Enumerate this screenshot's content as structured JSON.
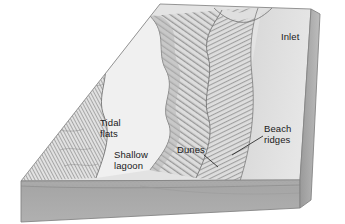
{
  "figure": {
    "type": "geologic-block-diagram",
    "background_color": "#ffffff"
  },
  "labels": {
    "inlet": "Inlet",
    "beach_ridges": "Beach\nridges",
    "dunes": "Dunes",
    "tidal_flats": "Tidal\nflats",
    "shallow_lagoon": "Shallow\nlagoon"
  },
  "colors": {
    "background": "#ffffff",
    "top_surface": "#e4e4e4",
    "lagoon": "#efefef",
    "ocean": "#dadada",
    "front_face": "#a9a9a9",
    "side_face": "#9b9b9b",
    "ink": "#6a6a6a",
    "text": "#1a1a1a"
  },
  "features": [
    {
      "name": "inlet",
      "description": "tidal inlet breaching the barrier"
    },
    {
      "name": "beach-ridges",
      "description": "parallel relict shoreline ridges"
    },
    {
      "name": "dunes",
      "description": "coastal dune field along the barrier"
    },
    {
      "name": "tidal-flats",
      "description": "hatched intertidal mud flats on mainland side"
    },
    {
      "name": "shallow-lagoon",
      "description": "open water behind the barrier"
    }
  ]
}
